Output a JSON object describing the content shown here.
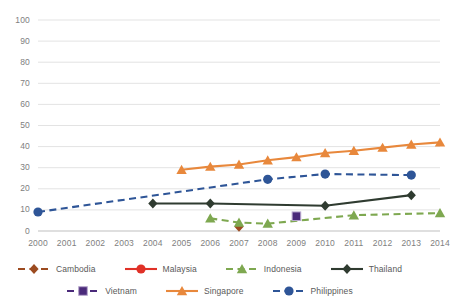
{
  "chart_data": {
    "type": "line",
    "title": "",
    "xlabel": "",
    "ylabel": "",
    "x": [
      2000,
      2001,
      2002,
      2003,
      2004,
      2005,
      2006,
      2007,
      2008,
      2009,
      2010,
      2011,
      2012,
      2013,
      2014
    ],
    "xtick_labels": [
      "2000",
      "2001",
      "2002",
      "2003",
      "2004",
      "2005",
      "2006",
      "2007",
      "2008",
      "2009",
      "2010",
      "2011",
      "2012",
      "2013",
      "2014"
    ],
    "ytick_labels": [
      "0",
      "10",
      "20",
      "30",
      "40",
      "50",
      "60",
      "70",
      "80",
      "90",
      "100"
    ],
    "yticks": [
      0,
      10,
      20,
      30,
      40,
      50,
      60,
      70,
      80,
      90,
      100
    ],
    "ylim": [
      0,
      100
    ],
    "xlim": [
      2000,
      2014
    ],
    "grid": "horizontal",
    "legend_position": "bottom",
    "series": [
      {
        "name": "Cambodia",
        "color": "#9C4B20",
        "line_style": "dashed",
        "marker": "diamond",
        "points": [
          {
            "x": 2007,
            "y": 2
          }
        ]
      },
      {
        "name": "Malaysia",
        "color": "#E03127",
        "line_style": "solid",
        "marker": "circle",
        "points": []
      },
      {
        "name": "Indonesia",
        "color": "#7EA850",
        "line_style": "dashed",
        "marker": "triangle",
        "points": [
          {
            "x": 2006,
            "y": 6
          },
          {
            "x": 2007,
            "y": 4
          },
          {
            "x": 2008,
            "y": 3.5
          },
          {
            "x": 2011,
            "y": 7.5
          },
          {
            "x": 2014,
            "y": 8.5
          }
        ]
      },
      {
        "name": "Thailand",
        "color": "#2F3B30",
        "line_style": "solid",
        "marker": "diamond",
        "points": [
          {
            "x": 2004,
            "y": 13
          },
          {
            "x": 2006,
            "y": 13
          },
          {
            "x": 2010,
            "y": 12
          },
          {
            "x": 2013,
            "y": 17
          }
        ]
      },
      {
        "name": "Vietnam",
        "color": "#4A2A7A",
        "line_style": "dashed",
        "marker": "square",
        "points": [
          {
            "x": 2009,
            "y": 7
          }
        ]
      },
      {
        "name": "Singapore",
        "color": "#E8883C",
        "line_style": "solid",
        "marker": "triangle",
        "points": [
          {
            "x": 2005,
            "y": 29
          },
          {
            "x": 2006,
            "y": 30.5
          },
          {
            "x": 2007,
            "y": 31.5
          },
          {
            "x": 2008,
            "y": 33.5
          },
          {
            "x": 2009,
            "y": 35
          },
          {
            "x": 2010,
            "y": 37
          },
          {
            "x": 2011,
            "y": 38
          },
          {
            "x": 2012,
            "y": 39.5
          },
          {
            "x": 2013,
            "y": 41
          },
          {
            "x": 2014,
            "y": 42
          }
        ]
      },
      {
        "name": "Philippines",
        "color": "#2E5597",
        "line_style": "dashed",
        "marker": "circle",
        "points": [
          {
            "x": 2000,
            "y": 9
          },
          {
            "x": 2008,
            "y": 24.5
          },
          {
            "x": 2010,
            "y": 27
          },
          {
            "x": 2013,
            "y": 26.5
          }
        ]
      }
    ]
  },
  "legend": {
    "rows": [
      [
        "Cambodia",
        "Malaysia",
        "Indonesia",
        "Thailand"
      ],
      [
        "Vietnam",
        "Singapore",
        "Philippines"
      ]
    ]
  }
}
